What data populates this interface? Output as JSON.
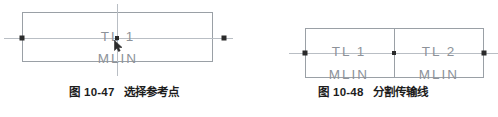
{
  "page": {
    "background_color": "#ffffff",
    "width": 498,
    "height": 117
  },
  "colors": {
    "box_stroke": "#9aa0a6",
    "wire_stroke": "#b9bec4",
    "node_fill": "#2b2b2b",
    "label_text": "#8d9299",
    "caption_text": "#1d1d1d"
  },
  "figures": [
    {
      "id": "figure-10-47",
      "caption_number": "图 10-47",
      "caption_title": "选择参考点",
      "components": [
        {
          "ref": "TL1",
          "model": "MLIN",
          "name_label": "TL 1",
          "type_label": "MLIN"
        }
      ],
      "nodes": [
        {
          "name": "left-terminal"
        },
        {
          "name": "right-terminal"
        },
        {
          "name": "reference-point"
        }
      ],
      "cursor": {
        "name": "selection-cursor",
        "visible": true
      }
    },
    {
      "id": "figure-10-48",
      "caption_number": "图 10-48",
      "caption_title": "分割传输线",
      "components": [
        {
          "ref": "TL1",
          "model": "MLIN",
          "name_label": "TL 1",
          "type_label": "MLIN"
        },
        {
          "ref": "TL2",
          "model": "MLIN",
          "name_label": "TL 2",
          "type_label": "MLIN"
        }
      ],
      "nodes": [
        {
          "name": "left-terminal"
        },
        {
          "name": "split-node"
        },
        {
          "name": "right-terminal"
        }
      ],
      "cursor": {
        "name": "selection-cursor",
        "visible": false
      }
    }
  ]
}
